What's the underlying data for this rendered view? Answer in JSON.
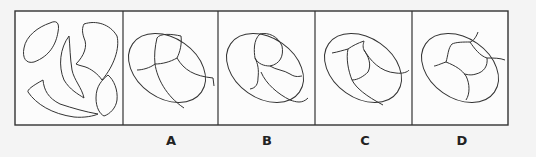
{
  "diagram": {
    "type": "visual-reasoning-puzzle",
    "question_panel": {
      "name": "pieces",
      "piece_count": 5
    },
    "options": [
      {
        "id": "A",
        "label": "A"
      },
      {
        "id": "B",
        "label": "B"
      },
      {
        "id": "C",
        "label": "C"
      },
      {
        "id": "D",
        "label": "D"
      }
    ],
    "colors": {
      "stroke": "#333333",
      "background": "#f4f4f4",
      "panel": "#fcfcfc"
    }
  }
}
